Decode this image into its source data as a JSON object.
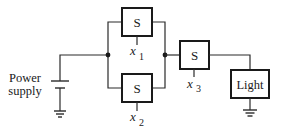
{
  "diagram": {
    "type": "circuit",
    "power_supply": {
      "label_line1": "Power",
      "label_line2": "supply"
    },
    "switches": [
      {
        "id": "s1",
        "label": "S",
        "var": "x",
        "sub": "1"
      },
      {
        "id": "s2",
        "label": "S",
        "var": "x",
        "sub": "2"
      },
      {
        "id": "s3",
        "label": "S",
        "var": "x",
        "sub": "3"
      }
    ],
    "load": {
      "label": "Light"
    },
    "topology": "S1 and S2 in parallel, in series with S3 and Light; power supply and light grounded",
    "colors": {
      "line": "#2a2a2a",
      "background": "#ffffff"
    }
  }
}
